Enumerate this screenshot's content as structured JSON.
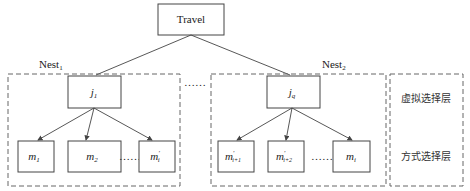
{
  "diagram": {
    "type": "nested-logit-tree",
    "root": {
      "label": "Travel"
    },
    "nests": [
      {
        "label": "Nest",
        "label_sub": "1",
        "node": {
          "label": "j",
          "sub": "1"
        },
        "children": [
          {
            "label": "m",
            "sub": "1",
            "sup": ""
          },
          {
            "label": "m",
            "sub": "2",
            "sup": ""
          },
          {
            "label": "m",
            "sub": "i",
            "sup": "'"
          }
        ]
      },
      {
        "label": "Nest",
        "label_sub": "2",
        "node": {
          "label": "j",
          "sub": "q"
        },
        "children": [
          {
            "label": "m",
            "sub": "i+1",
            "sup": "'"
          },
          {
            "label": "m",
            "sub": "i+2",
            "sup": "'"
          },
          {
            "label": "m",
            "sub": "i",
            "sup": ""
          }
        ]
      }
    ],
    "ellipsis": "……",
    "layers": {
      "virtual": "虚拟选择层",
      "mode": "方式选择层"
    },
    "colors": {
      "line": "#444444",
      "dash": "#666666",
      "text": "#222222"
    }
  }
}
